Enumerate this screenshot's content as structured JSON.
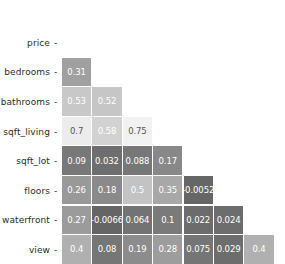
{
  "chart_data": {
    "type": "heatmap",
    "title": "",
    "xlabel": "",
    "ylabel": "",
    "grid": false,
    "legend": "none",
    "mask": "lower-triangle-excluding-diagonal",
    "colormap": "grayscale-light-is-high",
    "row_labels": [
      "price",
      "bedrooms",
      "bathrooms",
      "sqft_living",
      "sqft_lot",
      "floors",
      "waterfront",
      "view"
    ],
    "col_labels": [
      "price",
      "bedrooms",
      "bathrooms",
      "sqft_living",
      "sqft_lot",
      "floors",
      "waterfront"
    ],
    "rows": [
      {
        "label": "price",
        "cells": []
      },
      {
        "label": "bedrooms",
        "cells": [
          {
            "col": "price",
            "text": "0.31",
            "value": 0.31,
            "bg": "#a0a0a0",
            "fg": "#ffffff"
          }
        ]
      },
      {
        "label": "bathrooms",
        "cells": [
          {
            "col": "price",
            "text": "0.53",
            "value": 0.53,
            "bg": "#c8c8c8",
            "fg": "#ffffff"
          },
          {
            "col": "bedrooms",
            "text": "0.52",
            "value": 0.52,
            "bg": "#c6c6c6",
            "fg": "#ffffff"
          }
        ]
      },
      {
        "label": "sqft_living",
        "cells": [
          {
            "col": "price",
            "text": "0.7",
            "value": 0.7,
            "bg": "#ececec",
            "fg": "#555555"
          },
          {
            "col": "bedrooms",
            "text": "0.58",
            "value": 0.58,
            "bg": "#d2d2d2",
            "fg": "#ffffff"
          },
          {
            "col": "bathrooms",
            "text": "0.75",
            "value": 0.75,
            "bg": "#f2f2f2",
            "fg": "#555555"
          }
        ]
      },
      {
        "label": "sqft_lot",
        "cells": [
          {
            "col": "price",
            "text": "0.09",
            "value": 0.09,
            "bg": "#787878",
            "fg": "#ffffff"
          },
          {
            "col": "bedrooms",
            "text": "0.032",
            "value": 0.032,
            "bg": "#6e6e6e",
            "fg": "#ffffff"
          },
          {
            "col": "bathrooms",
            "text": "0.088",
            "value": 0.088,
            "bg": "#777777",
            "fg": "#ffffff"
          },
          {
            "col": "sqft_living",
            "text": "0.17",
            "value": 0.17,
            "bg": "#888888",
            "fg": "#ffffff"
          }
        ]
      },
      {
        "label": "floors",
        "cells": [
          {
            "col": "price",
            "text": "0.26",
            "value": 0.26,
            "bg": "#999999",
            "fg": "#ffffff"
          },
          {
            "col": "bedrooms",
            "text": "0.18",
            "value": 0.18,
            "bg": "#8a8a8a",
            "fg": "#ffffff"
          },
          {
            "col": "bathrooms",
            "text": "0.5",
            "value": 0.5,
            "bg": "#c3c3c3",
            "fg": "#ffffff"
          },
          {
            "col": "sqft_living",
            "text": "0.35",
            "value": 0.35,
            "bg": "#a8a8a8",
            "fg": "#ffffff"
          },
          {
            "col": "sqft_lot",
            "text": "-0.0052",
            "value": -0.0052,
            "bg": "#666666",
            "fg": "#ffffff"
          }
        ]
      },
      {
        "label": "waterfront",
        "cells": [
          {
            "col": "price",
            "text": "0.27",
            "value": 0.27,
            "bg": "#9b9b9b",
            "fg": "#ffffff"
          },
          {
            "col": "bedrooms",
            "text": "-0.0066",
            "value": -0.0066,
            "bg": "#656565",
            "fg": "#ffffff"
          },
          {
            "col": "bathrooms",
            "text": "0.064",
            "value": 0.064,
            "bg": "#737373",
            "fg": "#ffffff"
          },
          {
            "col": "sqft_living",
            "text": "0.1",
            "value": 0.1,
            "bg": "#7a7a7a",
            "fg": "#ffffff"
          },
          {
            "col": "sqft_lot",
            "text": "0.022",
            "value": 0.022,
            "bg": "#6c6c6c",
            "fg": "#ffffff"
          },
          {
            "col": "floors",
            "text": "0.024",
            "value": 0.024,
            "bg": "#6d6d6d",
            "fg": "#ffffff"
          }
        ]
      },
      {
        "label": "view",
        "cells": [
          {
            "col": "price",
            "text": "0.4",
            "value": 0.4,
            "bg": "#b0b0b0",
            "fg": "#ffffff"
          },
          {
            "col": "bedrooms",
            "text": "0.08",
            "value": 0.08,
            "bg": "#767676",
            "fg": "#ffffff"
          },
          {
            "col": "bathrooms",
            "text": "0.19",
            "value": 0.19,
            "bg": "#8c8c8c",
            "fg": "#ffffff"
          },
          {
            "col": "sqft_living",
            "text": "0.28",
            "value": 0.28,
            "bg": "#9d9d9d",
            "fg": "#ffffff"
          },
          {
            "col": "sqft_lot",
            "text": "0.075",
            "value": 0.075,
            "bg": "#757575",
            "fg": "#ffffff"
          },
          {
            "col": "floors",
            "text": "0.029",
            "value": 0.029,
            "bg": "#6d6d6d",
            "fg": "#ffffff"
          },
          {
            "col": "waterfront",
            "text": "0.4",
            "value": 0.4,
            "bg": "#b0b0b0",
            "fg": "#ffffff"
          }
        ]
      }
    ],
    "tick_marker": "-"
  },
  "layout": {
    "origin_x": 62,
    "origin_y": 28,
    "cell_w": 30.4,
    "cell_h": 29.6,
    "label_right_pad": 228,
    "row_pitch": 29.6
  }
}
